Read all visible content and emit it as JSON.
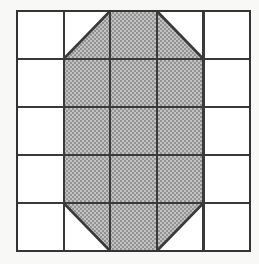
{
  "figure": {
    "name": "shaded-octagon-on-5x5-grid",
    "grid": {
      "columns": 5,
      "rows": 5,
      "origin_x": 17,
      "origin_y": 11,
      "cell_width": 46.6,
      "cell_height": 48.0,
      "line_color": "#3a3a3a",
      "line_width": 2.2,
      "outer_border_width": 2.6,
      "background_color": "#ffffff",
      "page_background_color": "#f8f8f7"
    },
    "shading": {
      "fill_color": "#aaaaaa",
      "fill_pattern": "50-percent-dither",
      "dither_light": "#c4c4c4",
      "dither_dark": "#8f8f8f"
    },
    "cells": [
      {
        "col": 1,
        "row": 1,
        "fill": "none"
      },
      {
        "col": 2,
        "row": 1,
        "fill": "triangle",
        "triangle": "lower-right"
      },
      {
        "col": 3,
        "row": 1,
        "fill": "full"
      },
      {
        "col": 4,
        "row": 1,
        "fill": "triangle",
        "triangle": "lower-left"
      },
      {
        "col": 5,
        "row": 1,
        "fill": "none"
      },
      {
        "col": 1,
        "row": 2,
        "fill": "none"
      },
      {
        "col": 2,
        "row": 2,
        "fill": "full"
      },
      {
        "col": 3,
        "row": 2,
        "fill": "full"
      },
      {
        "col": 4,
        "row": 2,
        "fill": "full"
      },
      {
        "col": 5,
        "row": 2,
        "fill": "none"
      },
      {
        "col": 1,
        "row": 3,
        "fill": "none"
      },
      {
        "col": 2,
        "row": 3,
        "fill": "full"
      },
      {
        "col": 3,
        "row": 3,
        "fill": "full"
      },
      {
        "col": 4,
        "row": 3,
        "fill": "full"
      },
      {
        "col": 5,
        "row": 3,
        "fill": "none"
      },
      {
        "col": 1,
        "row": 4,
        "fill": "none"
      },
      {
        "col": 2,
        "row": 4,
        "fill": "full"
      },
      {
        "col": 3,
        "row": 4,
        "fill": "full"
      },
      {
        "col": 4,
        "row": 4,
        "fill": "full"
      },
      {
        "col": 5,
        "row": 4,
        "fill": "none"
      },
      {
        "col": 1,
        "row": 5,
        "fill": "none"
      },
      {
        "col": 2,
        "row": 5,
        "fill": "triangle",
        "triangle": "upper-right"
      },
      {
        "col": 3,
        "row": 5,
        "fill": "full"
      },
      {
        "col": 4,
        "row": 5,
        "fill": "triangle",
        "triangle": "upper-left"
      },
      {
        "col": 5,
        "row": 5,
        "fill": "none"
      }
    ],
    "diagonals": [
      {
        "name": "top-left-diagonal",
        "col": 2,
        "row": 1,
        "from": "bottom-left",
        "to": "top-right"
      },
      {
        "name": "top-right-diagonal",
        "col": 4,
        "row": 1,
        "from": "top-left",
        "to": "bottom-right"
      },
      {
        "name": "bottom-left-diagonal",
        "col": 2,
        "row": 5,
        "from": "top-left",
        "to": "bottom-right"
      },
      {
        "name": "bottom-right-diagonal",
        "col": 4,
        "row": 5,
        "from": "bottom-left",
        "to": "top-right"
      }
    ],
    "shaded_area_units": 16,
    "total_area_units": 25
  }
}
